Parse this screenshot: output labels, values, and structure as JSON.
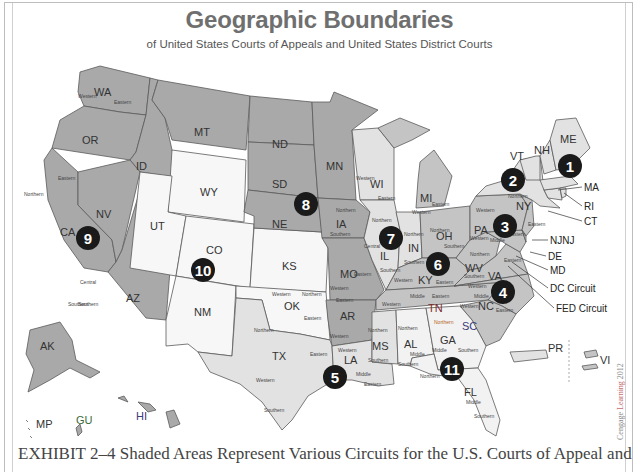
{
  "header": {
    "title": "Geographic Boundaries",
    "subtitle": "of United States Courts of Appeals and United States District Courts"
  },
  "colors": {
    "dark_circuit": "#a9a9a9",
    "mid_circuit": "#c4c4c4",
    "light_circuit": "#e0e0e0",
    "white_circuit": "#f7f7f7",
    "marker": "#1a1a1a",
    "border": "#555555"
  },
  "circuits": [
    {
      "number": "1",
      "states": [
        "ME",
        "NH",
        "MA",
        "RI",
        "PR"
      ]
    },
    {
      "number": "2",
      "states": [
        "NY",
        "VT",
        "CT"
      ]
    },
    {
      "number": "3",
      "states": [
        "PA",
        "NJ",
        "DE",
        "VI"
      ]
    },
    {
      "number": "4",
      "states": [
        "MD",
        "VA",
        "WV",
        "NC",
        "SC"
      ]
    },
    {
      "number": "5",
      "states": [
        "TX",
        "LA",
        "MS"
      ]
    },
    {
      "number": "6",
      "states": [
        "MI",
        "OH",
        "KY",
        "TN"
      ]
    },
    {
      "number": "7",
      "states": [
        "WI",
        "IL",
        "IN"
      ]
    },
    {
      "number": "8",
      "states": [
        "ND",
        "SD",
        "NE",
        "MN",
        "IA",
        "MO",
        "AR"
      ]
    },
    {
      "number": "9",
      "states": [
        "WA",
        "OR",
        "CA",
        "NV",
        "ID",
        "MT",
        "AZ",
        "AK",
        "HI",
        "GU",
        "MP"
      ]
    },
    {
      "number": "10",
      "states": [
        "WY",
        "UT",
        "CO",
        "KS",
        "NM",
        "OK"
      ]
    },
    {
      "number": "11",
      "states": [
        "GA",
        "AL",
        "FL"
      ]
    }
  ],
  "state_labels": {
    "WA": "WA",
    "OR": "OR",
    "CA": "CA",
    "NV": "NV",
    "ID": "ID",
    "MT": "MT",
    "AZ": "AZ",
    "WY": "WY",
    "UT": "UT",
    "CO": "CO",
    "NM": "NM",
    "KS": "KS",
    "OK": "OK",
    "ND": "ND",
    "SD": "SD",
    "NE": "NE",
    "MN": "MN",
    "IA": "IA",
    "MO": "MO",
    "AR": "AR",
    "TX": "TX",
    "LA": "LA",
    "MS": "MS",
    "AL": "AL",
    "GA": "GA",
    "FL": "FL",
    "WI": "WI",
    "IL": "IL",
    "IN": "IN",
    "MI": "MI",
    "OH": "OH",
    "KY": "KY",
    "TN": "TN",
    "WV": "WV",
    "VA": "VA",
    "NC": "NC",
    "SC": "SC",
    "PA": "PA",
    "NY": "NY",
    "VT": "VT",
    "NH": "NH",
    "ME": "ME",
    "AK": "AK",
    "HI": "HI",
    "MP": "MP",
    "GU": "GU",
    "PR": "PR",
    "VI": "VI"
  },
  "district_labels": {
    "wa_west": "Western",
    "wa_east": "Eastern",
    "ca_north": "Northern",
    "ca_east": "Eastern",
    "ca_central": "Central",
    "ca_south": "Southern",
    "wi_west": "Western",
    "wi_east": "Eastern",
    "mi_east": "Eastern",
    "mi_west": "Western",
    "ia_north": "Northern",
    "ia_south": "Southern",
    "il_north": "Northern",
    "il_central": "Central",
    "il_south": "Southern",
    "in_north": "Northern",
    "in_south": "Southern",
    "oh_north": "Northern",
    "oh_south": "Southern",
    "pa_west": "Western",
    "pa_middle": "Middle",
    "pa_east": "Eastern",
    "ny_north": "Northern",
    "ny_west": "Western",
    "ny_east": "Eastern",
    "mo_west": "Western",
    "mo_east": "Eastern",
    "ok_west": "Western",
    "ok_north": "Northern",
    "ok_east": "Eastern",
    "ky_west": "Western",
    "ky_east": "Eastern",
    "tn_west": "Western",
    "tn_middle": "Middle",
    "tn_east": "Eastern",
    "wv_north": "Northern",
    "wv_south": "Southern",
    "va_west": "Western",
    "va_east": "Eastern",
    "nc_west": "Western",
    "nc_middle": "Middle",
    "nc_east": "Eastern",
    "ar_west": "Western",
    "ar_east": "Eastern",
    "tx_north": "Northern",
    "tx_east": "Eastern",
    "tx_west": "Western",
    "tx_south": "Southern",
    "la_west": "Western",
    "la_middle": "Middle",
    "la_east": "Eastern",
    "ms_north": "Northern",
    "ms_south": "Southern",
    "al_north": "Northern",
    "al_middle": "Middle",
    "al_south": "Southern",
    "ga_north": "Northern",
    "ga_middle": "Middle",
    "ga_south": "Southern",
    "fl_north": "Northern",
    "fl_middle": "Middle",
    "fl_south": "Southern",
    "az_south": "Southern"
  },
  "callouts": {
    "ma": "MA",
    "ri": "RI",
    "ct": "CT",
    "nj": "NJNJ",
    "de": "DE",
    "md": "MD",
    "dc": "DC Circuit",
    "fed": "FED Circuit"
  },
  "caption": "EXHIBIT 2–4  Shaded Areas Represent Various Circuits for the U.S. Courts of Appeal and",
  "credit": {
    "prefix": "Cengage ",
    "highlight": "Learning",
    "year": " 2012"
  }
}
